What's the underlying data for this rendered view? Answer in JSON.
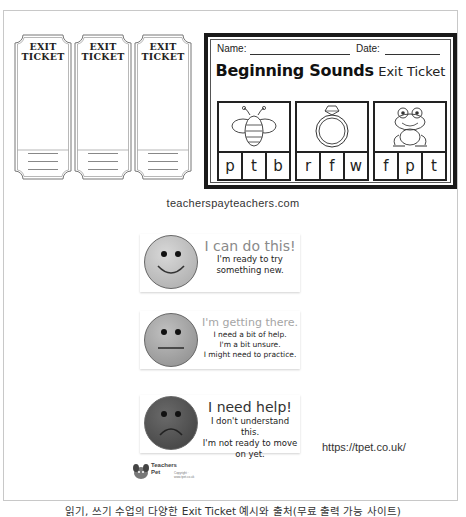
{
  "exit_tickets": {
    "title_line1": "EXIT",
    "title_line2": "TICKET",
    "count": 3,
    "field_labels": [
      "NAME",
      "DATE",
      "PERIOD"
    ]
  },
  "beginning_sounds": {
    "name_label": "Name:",
    "date_label": "Date:",
    "title_bold": "Beginning Sounds",
    "title_regular": "Exit Ticket",
    "items": [
      {
        "picture": "bee-icon",
        "letters": [
          "p",
          "t",
          "b"
        ]
      },
      {
        "picture": "ring-icon",
        "letters": [
          "r",
          "f",
          "w"
        ]
      },
      {
        "picture": "frog-icon",
        "letters": [
          "f",
          "p",
          "t"
        ]
      }
    ]
  },
  "source1": "teacherspayteachers.com",
  "feeling_cards": [
    {
      "face": "happy-face-icon",
      "heading": "I can do this!",
      "lines": [
        "I'm ready to try",
        "something new."
      ],
      "face_color": "#bdbdbd",
      "heading_color": "#888888"
    },
    {
      "face": "neutral-face-icon",
      "heading": "I'm getting there.",
      "lines": [
        "I need a bit of help.",
        "I'm a bit unsure.",
        "I might need to practice."
      ],
      "face_color": "#9a9a9a",
      "heading_color": "#a0a0a0"
    },
    {
      "face": "sad-face-icon",
      "heading": "I need help!",
      "lines": [
        "I don't understand this.",
        "I'm not ready to move",
        "on yet."
      ],
      "face_color": "#555555",
      "heading_color": "#333333"
    }
  ],
  "logo": {
    "text_line1": "Teachers",
    "text_line2": "Pet",
    "copyright": "Copyright · www.tpet.co.uk"
  },
  "source2": "https://tpet.co.uk/",
  "caption": "읽기, 쓰기 수업의 다양한 Exit Ticket 예시와 출처(무료 출력 가능 사이트)"
}
